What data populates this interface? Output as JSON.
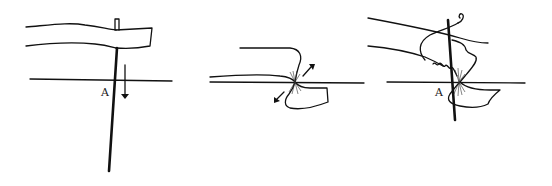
{
  "figure": {
    "panels": [
      {
        "id": "panel-1",
        "label": "A"
      },
      {
        "id": "panel-2",
        "label": ""
      },
      {
        "id": "panel-3",
        "label": "A"
      }
    ],
    "colors": {
      "ink": "#111111",
      "background": "#ffffff"
    }
  }
}
